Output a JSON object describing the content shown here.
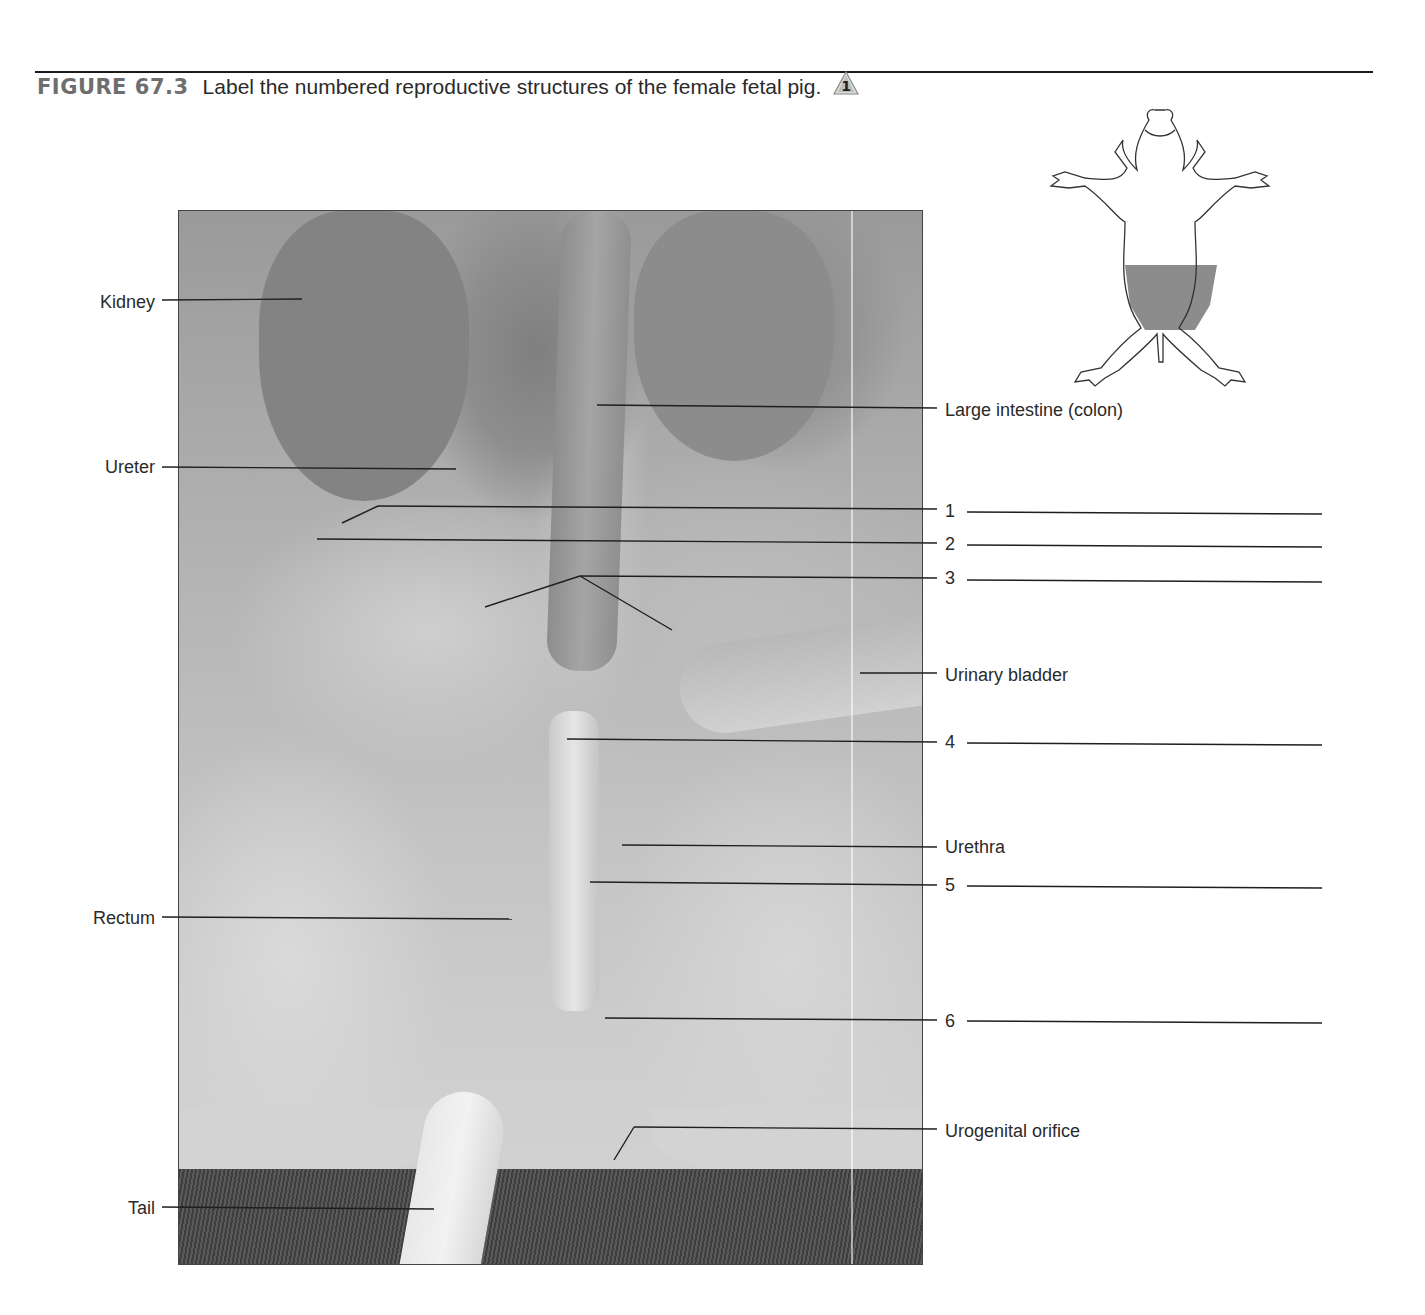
{
  "figure": {
    "number": "FIGURE 67.3",
    "caption": "Label the numbered reproductive structures of the female fetal pig.",
    "badge_icon": "triangle-number-badge-icon",
    "badge_text": "1"
  },
  "orientation_diagram": {
    "description": "Ventral view of fetal pig outline with shaded lower abdominal region",
    "shaded_region": "lower abdomen / pelvic region",
    "shade_color": "#8c8c8c"
  },
  "left_labels": [
    {
      "text": "Kidney",
      "y": 302
    },
    {
      "text": "Ureter",
      "y": 467
    },
    {
      "text": "Rectum",
      "y": 918
    },
    {
      "text": "Tail",
      "y": 1208
    }
  ],
  "right_labels": [
    {
      "text": "Large intestine (colon)",
      "y": 410
    },
    {
      "text": "1",
      "y": 511,
      "blank": true
    },
    {
      "text": "2",
      "y": 544,
      "blank": true
    },
    {
      "text": "3",
      "y": 578,
      "blank": true
    },
    {
      "text": "Urinary bladder",
      "y": 675
    },
    {
      "text": "4",
      "y": 742,
      "blank": true
    },
    {
      "text": "Urethra",
      "y": 847
    },
    {
      "text": "5",
      "y": 885,
      "blank": true
    },
    {
      "text": "6",
      "y": 1021,
      "blank": true
    },
    {
      "text": "Urogenital orifice",
      "y": 1131
    }
  ]
}
